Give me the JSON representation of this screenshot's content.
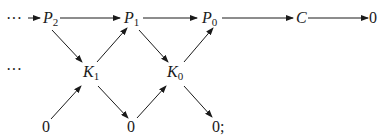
{
  "diagram": {
    "type": "commutative-diagram",
    "top_row": {
      "leading": "···",
      "nodes": [
        {
          "base": "P",
          "sub": "2"
        },
        {
          "base": "P",
          "sub": "1"
        },
        {
          "base": "P",
          "sub": "0"
        },
        {
          "base": "C",
          "sub": ""
        },
        {
          "base": "0",
          "sub": ""
        }
      ]
    },
    "middle_row": {
      "leading": "···",
      "nodes": [
        {
          "base": "K",
          "sub": "1"
        },
        {
          "base": "K",
          "sub": "0"
        }
      ]
    },
    "bottom_row": {
      "nodes": [
        "0",
        "0",
        "0;"
      ]
    },
    "edges": [
      [
        "...",
        "P2"
      ],
      [
        "P2",
        "P1"
      ],
      [
        "P1",
        "P0"
      ],
      [
        "P0",
        "C"
      ],
      [
        "C",
        "0"
      ],
      [
        "P2",
        "K1"
      ],
      [
        "K1",
        "P1"
      ],
      [
        "P1",
        "K0"
      ],
      [
        "K0",
        "P0"
      ],
      [
        "0a",
        "K1"
      ],
      [
        "K1",
        "0b"
      ],
      [
        "0b",
        "K0"
      ],
      [
        "K0",
        "0c"
      ]
    ],
    "colors": {
      "ink": "#1a1a1a",
      "background": "#ffffff"
    }
  }
}
